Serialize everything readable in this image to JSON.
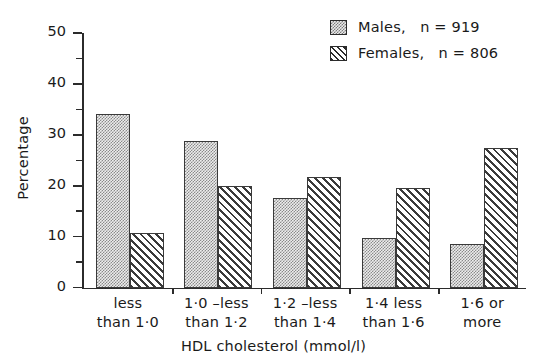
{
  "chart_data": {
    "type": "bar",
    "title": "",
    "subtitle": "",
    "xlabel": "HDL cholesterol  (mmol/l)",
    "ylabel": "Percentage",
    "categories": [
      "less\nthan 1·0",
      "1·0 –less\nthan 1·2",
      "1·2 –less\nthan 1·4",
      "1·4  less\nthan 1·6",
      "1·6 or\nmore"
    ],
    "series": [
      {
        "name": "Males,   n = 919",
        "short_name": "Males",
        "n": 919,
        "pattern": "stipple",
        "values": [
          34.0,
          28.8,
          17.6,
          9.8,
          8.6
        ]
      },
      {
        "name": "Females,   n = 806",
        "short_name": "Females",
        "n": 806,
        "pattern": "diagonal-hatch",
        "values": [
          10.8,
          19.9,
          21.7,
          19.6,
          27.4
        ]
      }
    ],
    "ylim": [
      0,
      50
    ],
    "ytick_labels": [
      "0",
      "10",
      "20",
      "30",
      "40",
      "50"
    ],
    "ytick_values": [
      0,
      10,
      20,
      30,
      40,
      50
    ],
    "yminor_values": [
      5,
      15,
      25,
      35,
      45
    ],
    "grid": false,
    "legend_position": "top-right",
    "colors": {
      "line": "#2b2b2b",
      "bar_outline": "#3a3a3a",
      "males_fill": "#ededed",
      "females_fill": "#ffffff",
      "background": "#ffffff"
    }
  },
  "legend": {
    "entries": [
      {
        "label": "Males,   n = 919",
        "swatch": "males-swatch-icon"
      },
      {
        "label": "Females,   n = 806",
        "swatch": "females-swatch-icon"
      }
    ]
  },
  "axes": {
    "y_title": "Percentage",
    "x_title": "HDL cholesterol  (mmol/l)"
  }
}
